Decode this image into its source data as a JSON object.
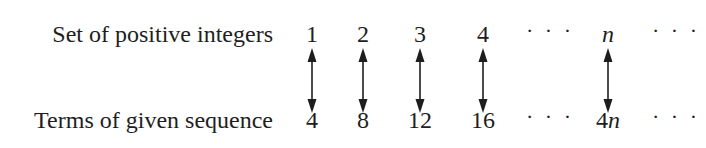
{
  "rows": {
    "top_label": "Set of positive integers",
    "bottom_label": "Terms of given sequence"
  },
  "columns": [
    {
      "top": "1",
      "bottom": "4",
      "x": 312,
      "arrow": true
    },
    {
      "top": "2",
      "bottom": "8",
      "x": 363,
      "arrow": true
    },
    {
      "top": "3",
      "bottom": "12",
      "x": 420,
      "arrow": true
    },
    {
      "top": "4",
      "bottom": "16",
      "x": 483,
      "arrow": true
    },
    {
      "top": "· · ·",
      "bottom": "· · ·",
      "x": 550,
      "arrow": false
    },
    {
      "top": "n",
      "bottom": "4n",
      "x": 608,
      "arrow": true,
      "italic_var": true
    },
    {
      "top": "· · ·",
      "bottom": "· · ·",
      "x": 676,
      "arrow": false
    }
  ],
  "arrow_icon": "double-headed-vertical-arrow",
  "colors": {
    "ink": "#1e1e1e",
    "background": "#ffffff"
  }
}
